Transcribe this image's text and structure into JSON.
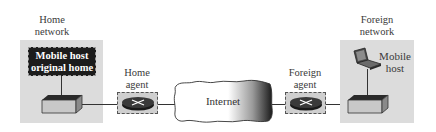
{
  "diagram": {
    "home_network": {
      "label_line1": "Home",
      "label_line2": "network",
      "mobile_host_box": {
        "line1": "Mobile host",
        "line2": "original home"
      }
    },
    "home_agent": {
      "label_line1": "Home",
      "label_line2": "agent"
    },
    "internet": {
      "label": "Internet"
    },
    "foreign_agent": {
      "label_line1": "Foreign",
      "label_line2": "agent"
    },
    "foreign_network": {
      "label_line1": "Foreign",
      "label_line2": "network",
      "mobile_host": {
        "line1": "Mobile",
        "line2": "host"
      }
    },
    "colors": {
      "network_bg": "#dcdcdc",
      "agent_box_bg": "#cfcfcf",
      "host_box_bg": "#1c1c1c",
      "link": "#333333"
    }
  }
}
